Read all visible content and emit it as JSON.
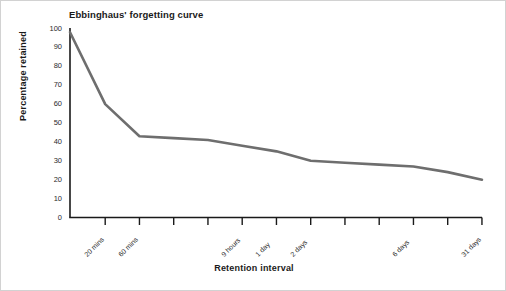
{
  "chart_data": {
    "type": "line",
    "title": "Ebbinghaus' forgetting curve",
    "xlabel": "Retention interval",
    "ylabel": "Percentage retained",
    "ylim": [
      0,
      100
    ],
    "ytick_values": [
      100,
      90,
      80,
      70,
      60,
      50,
      40,
      30,
      20,
      10,
      0
    ],
    "ytick_labels": [
      "100",
      "90",
      "80",
      "70",
      "60",
      "50",
      "40",
      "30",
      "20",
      "10",
      "0"
    ],
    "grid": false,
    "legend": "none",
    "line_color": "#6e6e6e",
    "axis_color": "#1a1a1a",
    "tick_count": 12,
    "xtick_labels": [
      "20 mins",
      "60 mins",
      "",
      "",
      "9 hours",
      "1 day",
      "2 days",
      "",
      "",
      "6 days",
      "",
      "31 days"
    ],
    "categories": [
      "0 (immediate)",
      "20 mins",
      "60 mins",
      "",
      "",
      "9 hours",
      "1 day",
      "2 days",
      "",
      "",
      "6 days",
      "",
      "31 days"
    ],
    "series": [
      {
        "name": "Percentage retained",
        "values": [
          98,
          60,
          43,
          42,
          41,
          38,
          35,
          30,
          29,
          28,
          27,
          24,
          20
        ]
      }
    ],
    "points": [
      {
        "x": 0.0,
        "label": "immediately",
        "y": 98
      },
      {
        "x": 1.0,
        "label": "20 mins",
        "y": 60
      },
      {
        "x": 2.0,
        "label": "60 mins",
        "y": 43
      },
      {
        "x": 3.0,
        "label": "",
        "y": 42
      },
      {
        "x": 4.0,
        "label": "",
        "y": 41
      },
      {
        "x": 5.0,
        "label": "9 hours",
        "y": 38
      },
      {
        "x": 6.0,
        "label": "1 day",
        "y": 35
      },
      {
        "x": 7.0,
        "label": "2 days",
        "y": 30
      },
      {
        "x": 8.0,
        "label": "",
        "y": 29
      },
      {
        "x": 9.0,
        "label": "",
        "y": 28
      },
      {
        "x": 10.0,
        "label": "6 days",
        "y": 27
      },
      {
        "x": 11.0,
        "label": "",
        "y": 24
      },
      {
        "x": 12.0,
        "label": "31 days",
        "y": 20
      }
    ]
  }
}
